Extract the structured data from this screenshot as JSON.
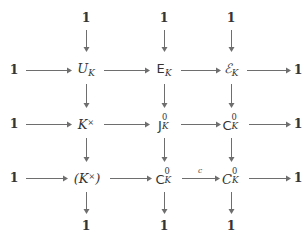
{
  "diagram": {
    "kind": "commutative-diagram",
    "trivial_label": "1",
    "rows": [
      {
        "id": "row-top-units",
        "left_terminal": "1",
        "right_terminal": "1",
        "nodes": [
          {
            "id": "U_K",
            "base": "U",
            "sub": "K",
            "sup": "",
            "style": "italic"
          },
          {
            "id": "E_K",
            "base": "E",
            "sub": "K",
            "sup": "",
            "style": "sans-serif"
          },
          {
            "id": "calE_K",
            "base": "ℰ",
            "sub": "K",
            "sup": "",
            "style": "script"
          }
        ]
      },
      {
        "id": "row-middle-ideles",
        "left_terminal": "1",
        "right_terminal": "1",
        "nodes": [
          {
            "id": "Kx",
            "base": "K",
            "sub": "",
            "sup": "×",
            "style": "italic"
          },
          {
            "id": "J_K_0",
            "base": "J",
            "sub": "K",
            "sup": "0",
            "style": "sans-serif"
          },
          {
            "id": "C_K_0",
            "base": "C",
            "sub": "K",
            "sup": "0",
            "style": "sans-serif"
          }
        ]
      },
      {
        "id": "row-bottom-classes",
        "left_terminal": "1",
        "right_terminal": "1",
        "nodes": [
          {
            "id": "paren_Kx",
            "base": "(K",
            "sub": "",
            "sup": "×",
            "style": "italic",
            "close": ")"
          },
          {
            "id": "C_K_0_b",
            "base": "C",
            "sub": "K",
            "sup": "0",
            "style": "sans-serif"
          },
          {
            "id": "calC_K_0",
            "base": "𝒞",
            "sub": "K",
            "sup": "0",
            "style": "script"
          }
        ]
      }
    ],
    "column_terminals": {
      "top": [
        "1",
        "1",
        "1"
      ],
      "bottom": [
        "1",
        "1",
        "1"
      ]
    },
    "arrow_labels": {
      "bottom_middle_horizontal": "c"
    },
    "colors": {
      "background": "#ffffff",
      "text": "#343434",
      "arrow": "#6e6e6e"
    }
  }
}
